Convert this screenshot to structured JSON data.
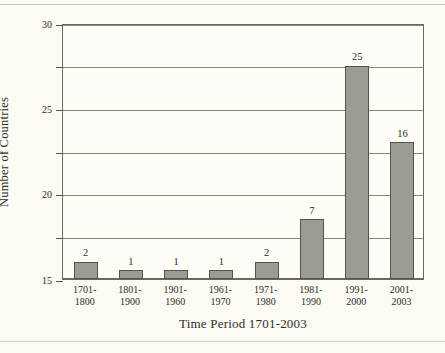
{
  "chart_data": {
    "type": "bar",
    "title": "",
    "xlabel": "Time Period 1701-2003",
    "ylabel": "Number of Countries",
    "categories": [
      "1701-\n1800",
      "1801-\n1900",
      "1901-\n1960",
      "1961-\n1970",
      "1971-\n1980",
      "1981-\n1990",
      "1991-\n2000",
      "2001-\n2003"
    ],
    "category_lines": [
      [
        "1701-",
        "1800"
      ],
      [
        "1801-",
        "1900"
      ],
      [
        "1901-",
        "1960"
      ],
      [
        "1961-",
        "1970"
      ],
      [
        "1971-",
        "1980"
      ],
      [
        "1981-",
        "1990"
      ],
      [
        "1991-",
        "2000"
      ],
      [
        "2001-",
        "2003"
      ]
    ],
    "values": [
      2,
      1,
      1,
      1,
      2,
      7,
      25,
      16
    ],
    "data_labels": [
      "2",
      "1",
      "1",
      "1",
      "2",
      "7",
      "25",
      "16"
    ],
    "ylim": [
      0,
      30
    ],
    "ytick_values": [
      0,
      5,
      10,
      15,
      20,
      25,
      30
    ],
    "ytick_labels": [
      "0",
      "5",
      "10",
      "15",
      "20",
      "25",
      "30"
    ],
    "grid": "horizontal",
    "legend": "none",
    "bar_color": "#9d9c92",
    "bar_edge_color": "#55544a",
    "plot_background": "#fdfcf7",
    "page_background": "#fbfaf3",
    "axis_color": "#6b6a5e",
    "grid_color": "#8a887a",
    "text_color": "#2e2e28"
  }
}
